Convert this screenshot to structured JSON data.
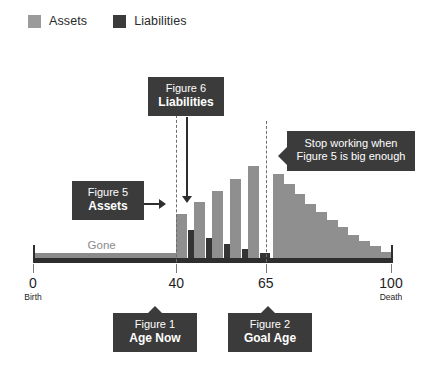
{
  "legend": {
    "items": [
      {
        "label": "Assets",
        "color": "#9b9b9b",
        "key": "assets"
      },
      {
        "label": "Liabilities",
        "color": "#3b3b3b",
        "key": "liabilities"
      }
    ]
  },
  "axis": {
    "ticks": [
      {
        "value": "0",
        "sub": "Birth",
        "pos": 0
      },
      {
        "value": "40",
        "sub": "",
        "pos": 40
      },
      {
        "value": "65",
        "sub": "",
        "pos": 65
      },
      {
        "value": "100",
        "sub": "Death",
        "pos": 100
      }
    ],
    "gone_label": "Gone"
  },
  "callouts": {
    "liabilities": {
      "line1": "Figure 6",
      "line2": "Liabilities"
    },
    "assets": {
      "line1": "Figure 5",
      "line2": "Assets"
    },
    "stop_working": {
      "line1": "Stop working when",
      "line2": "Figure 5 is big enough"
    },
    "age_now": {
      "line1": "Figure 1",
      "line2": "Age Now"
    },
    "goal_age": {
      "line1": "Figure 2",
      "line2": "Goal Age"
    }
  },
  "chart_data": {
    "type": "bar",
    "title": "",
    "subtitle": "",
    "xlabel": "Age",
    "ylabel": "",
    "grid": false,
    "legend_position": "top-left",
    "xlim": [
      0,
      100
    ],
    "ylim": [
      0,
      100
    ],
    "annotations": [
      {
        "text": "Gone",
        "x_range": [
          0,
          40
        ],
        "note": "grey bar spanning birth to age now"
      },
      {
        "text": "Figure 5 Assets",
        "points_to": "first assets bar at age 40"
      },
      {
        "text": "Figure 6 Liabilities",
        "points_to": "first liabilities bar at age 41"
      },
      {
        "text": "Stop working when Figure 5 is big enough",
        "points_to": "age 65 marker"
      },
      {
        "text": "Figure 1 Age Now",
        "points_to": "age 40 tick"
      },
      {
        "text": "Figure 2 Goal Age",
        "points_to": "age 65 tick"
      }
    ],
    "markers": [
      {
        "label": "Age Now",
        "x": 40,
        "style": "dashed"
      },
      {
        "label": "Goal Age",
        "x": 65,
        "style": "dashed"
      }
    ],
    "categories": [
      40,
      45,
      50,
      55,
      60,
      67,
      70,
      73,
      76,
      79,
      82,
      85,
      88,
      91,
      94,
      97
    ],
    "series": [
      {
        "name": "Assets",
        "color": "#8f8f8f",
        "values": [
          34,
          44,
          52,
          62,
          72,
          66,
          58,
          50,
          42,
          36,
          30,
          24,
          18,
          13,
          9,
          5
        ]
      },
      {
        "name": "Liabilities",
        "color": "#343434",
        "values": [
          22,
          16,
          11,
          7,
          4,
          0,
          0,
          0,
          0,
          0,
          0,
          0,
          0,
          0,
          0,
          0
        ]
      }
    ]
  }
}
